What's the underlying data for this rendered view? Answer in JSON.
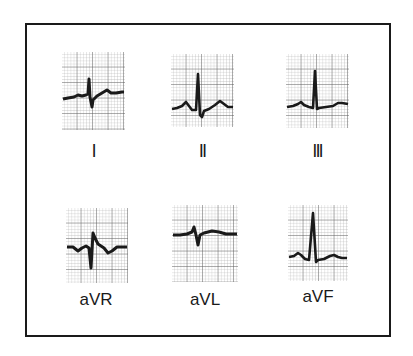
{
  "figure": {
    "leads": [
      {
        "id": "I",
        "label": "I"
      },
      {
        "id": "II",
        "label": "II"
      },
      {
        "id": "III",
        "label": "III"
      },
      {
        "id": "aVR",
        "label": "aVR"
      },
      {
        "id": "aVL",
        "label": "aVL"
      },
      {
        "id": "aVF",
        "label": "aVF"
      }
    ],
    "colors": {
      "ink": "#1a1a1a",
      "grid_minor": "#9a9a9a",
      "grid_major": "#555555",
      "background": "#ffffff"
    }
  }
}
